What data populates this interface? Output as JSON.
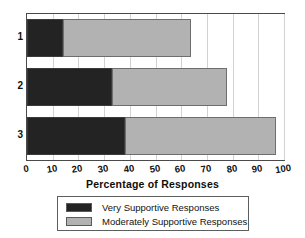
{
  "chart_data": {
    "type": "bar",
    "orientation": "horizontal",
    "stacked": true,
    "title": "",
    "xlabel": "Percentage of Responses",
    "ylabel": "",
    "categories": [
      "1",
      "2",
      "3"
    ],
    "xlim": [
      0,
      100
    ],
    "ylim": [
      0,
      3
    ],
    "xticks": [
      "0",
      "10",
      "20",
      "30",
      "40",
      "50",
      "60",
      "70",
      "80",
      "90",
      "100"
    ],
    "xtick_values": [
      0,
      10,
      20,
      30,
      40,
      50,
      60,
      70,
      80,
      90,
      100
    ],
    "grid": "vertical",
    "legend_position": "below-axes",
    "series": [
      {
        "name": "Very Supportive Responses",
        "color": "#232323",
        "values": [
          14,
          33,
          38
        ]
      },
      {
        "name": "Moderately Supportive Responses",
        "color": "#b2b2b2",
        "values": [
          50,
          45,
          59
        ]
      }
    ],
    "cumulative_totals": [
      64,
      78,
      97
    ],
    "annotations": []
  },
  "axis": {
    "x_title": "Percentage of Responses"
  },
  "legend": {
    "entries": [
      {
        "label": "Very Supportive Responses",
        "swatch": "dark"
      },
      {
        "label": "Moderately Supportive Responses",
        "swatch": "light"
      }
    ]
  },
  "colors": {
    "very_supportive": "#232323",
    "moderately_supportive": "#b2b2b2",
    "frame": "#4a4a4a",
    "grid": "#d2d2d2",
    "background": "#ffffff"
  }
}
